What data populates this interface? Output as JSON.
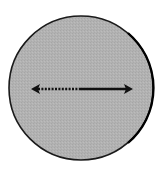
{
  "diagram": {
    "type": "circle-with-diameter",
    "circle": {
      "cx": 81,
      "cy": 88,
      "r": 72,
      "fill": "#b2b2b2",
      "stroke": "#1a1a1a"
    },
    "arrow": {
      "y": 89,
      "x_start": 31,
      "x_mid": 80,
      "x_end": 133,
      "left_segment_style": "dotted",
      "right_segment_style": "solid",
      "color": "#111111",
      "heads": [
        "left",
        "right"
      ]
    }
  }
}
